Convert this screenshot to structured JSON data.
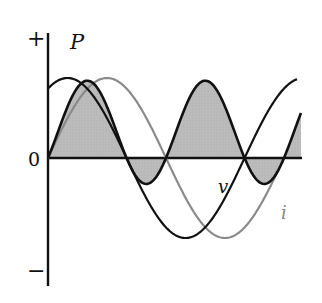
{
  "diagram": {
    "labels": {
      "plus": "+",
      "minus": "−",
      "zero": "0",
      "power": "P",
      "voltage": "v",
      "current": "i"
    },
    "curves": [
      {
        "name": "v",
        "description": "voltage, black, leads",
        "color": "#111111"
      },
      {
        "name": "i",
        "description": "current, gray, lags voltage",
        "color": "#8a8a8a"
      },
      {
        "name": "P",
        "description": "instantaneous power, black outline with gray fill (positive and negative lobes)",
        "color": "#111111",
        "fill": "#b9b9b9"
      }
    ],
    "colors": {
      "axis": "#111111",
      "voltage": "#111111",
      "current": "#8a8a8a",
      "power_fill": "#b9b9b9",
      "power_stroke": "#111111"
    }
  }
}
